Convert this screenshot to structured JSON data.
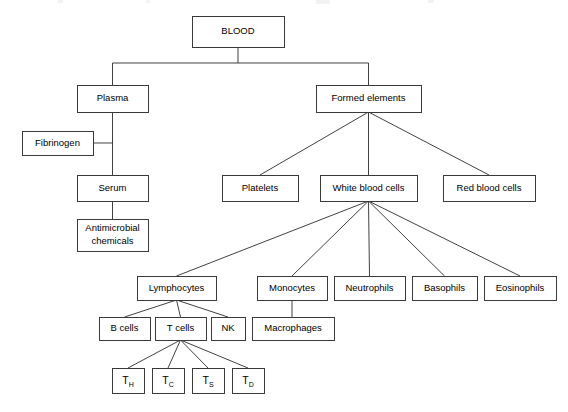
{
  "diagram": {
    "type": "tree-hierarchy",
    "background_color": "#ffffff",
    "box_border_color": "#3a3a3a",
    "connector_color": "#2b2b2b",
    "text_color": "#000000",
    "nodes": [
      {
        "id": "blood",
        "label": "BLOOD",
        "x": 192,
        "y": 16,
        "w": 92,
        "h": 31,
        "lines": 1
      },
      {
        "id": "plasma",
        "label": "Plasma",
        "x": 77,
        "y": 85,
        "w": 71,
        "h": 27,
        "lines": 1
      },
      {
        "id": "formed",
        "label": "Formed elements",
        "x": 316,
        "y": 85,
        "w": 105,
        "h": 27,
        "lines": 1
      },
      {
        "id": "fibrinogen",
        "label": "Fibrinogen",
        "x": 22,
        "y": 131,
        "w": 71,
        "h": 24,
        "lines": 1
      },
      {
        "id": "serum",
        "label": "Serum",
        "x": 77,
        "y": 175,
        "w": 71,
        "h": 26,
        "lines": 1
      },
      {
        "id": "antimicrobial",
        "label": "Antimicrobial chemicals",
        "x": 77,
        "y": 219,
        "w": 71,
        "h": 32,
        "lines": 2,
        "line1": "Antimicrobial",
        "line2": "chemicals"
      },
      {
        "id": "platelets",
        "label": "Platelets",
        "x": 222,
        "y": 175,
        "w": 76,
        "h": 26,
        "lines": 1
      },
      {
        "id": "wbc",
        "label": "White blood cells",
        "x": 320,
        "y": 175,
        "w": 97,
        "h": 26,
        "lines": 1
      },
      {
        "id": "rbc",
        "label": "Red blood cells",
        "x": 443,
        "y": 175,
        "w": 92,
        "h": 26,
        "lines": 1
      },
      {
        "id": "lymphocytes",
        "label": "Lymphocytes",
        "x": 137,
        "y": 276,
        "w": 79,
        "h": 24,
        "lines": 1
      },
      {
        "id": "monocytes",
        "label": "Monocytes",
        "x": 257,
        "y": 276,
        "w": 70,
        "h": 24,
        "lines": 1
      },
      {
        "id": "neutrophils",
        "label": "Neutrophils",
        "x": 334,
        "y": 276,
        "w": 71,
        "h": 24,
        "lines": 1
      },
      {
        "id": "basophils",
        "label": "Basophils",
        "x": 412,
        "y": 276,
        "w": 65,
        "h": 24,
        "lines": 1
      },
      {
        "id": "eosinophils",
        "label": "Eosinophils",
        "x": 484,
        "y": 276,
        "w": 72,
        "h": 24,
        "lines": 1
      },
      {
        "id": "bcells",
        "label": "B cells",
        "x": 99,
        "y": 317,
        "w": 51,
        "h": 23,
        "lines": 1
      },
      {
        "id": "tcells",
        "label": "T cells",
        "x": 155,
        "y": 317,
        "w": 51,
        "h": 23,
        "lines": 1
      },
      {
        "id": "nk",
        "label": "NK",
        "x": 211,
        "y": 317,
        "w": 34,
        "h": 23,
        "lines": 1
      },
      {
        "id": "macrophages",
        "label": "Macrophages",
        "x": 252,
        "y": 317,
        "w": 82,
        "h": 23,
        "lines": 1
      },
      {
        "id": "th",
        "label": "TH",
        "base": "T",
        "sub": "H",
        "x": 112,
        "y": 368,
        "w": 32,
        "h": 25,
        "lines": 1,
        "subscript": true
      },
      {
        "id": "tc",
        "label": "TC",
        "base": "T",
        "sub": "C",
        "x": 152,
        "y": 368,
        "w": 32,
        "h": 25,
        "lines": 1,
        "subscript": true
      },
      {
        "id": "ts",
        "label": "TS",
        "base": "T",
        "sub": "S",
        "x": 192,
        "y": 368,
        "w": 32,
        "h": 25,
        "lines": 1,
        "subscript": true
      },
      {
        "id": "td",
        "label": "TD",
        "base": "T",
        "sub": "D",
        "x": 232,
        "y": 368,
        "w": 32,
        "h": 25,
        "lines": 1,
        "subscript": true
      }
    ],
    "connectors": [
      {
        "id": "blood-split",
        "from": "blood",
        "to": "plasma-and-formed",
        "path": "M238,47 L238,63 M112.5,63 L368.5,63 M112.5,63 L112.5,85 M368.5,63 L368.5,85"
      },
      {
        "id": "plasma-serum",
        "from": "plasma",
        "to": "serum",
        "path": "M112.5,112 L112.5,175"
      },
      {
        "id": "fibrinogen-link",
        "from": "fibrinogen",
        "to": "plasma-serum-line",
        "path": "M93,143 L112.5,143"
      },
      {
        "id": "serum-antimicrobial",
        "from": "serum",
        "to": "antimicrobial",
        "path": "M112.5,201 L112.5,219"
      },
      {
        "id": "formed-platelets",
        "from": "formed",
        "to": "platelets",
        "path": "M368.5,112 L260,175"
      },
      {
        "id": "formed-wbc",
        "from": "formed",
        "to": "wbc",
        "path": "M368.5,112 L368.5,175"
      },
      {
        "id": "formed-rbc",
        "from": "formed",
        "to": "rbc",
        "path": "M368.5,112 L489,175"
      },
      {
        "id": "wbc-lymphocytes",
        "from": "wbc",
        "to": "lymphocytes",
        "path": "M368.5,201 L176.5,276"
      },
      {
        "id": "wbc-monocytes",
        "from": "wbc",
        "to": "monocytes",
        "path": "M368.5,201 L292,276"
      },
      {
        "id": "wbc-neutrophils",
        "from": "wbc",
        "to": "neutrophils",
        "path": "M368.5,201 L369.5,276"
      },
      {
        "id": "wbc-basophils",
        "from": "wbc",
        "to": "basophils",
        "path": "M368.5,201 L444.5,276"
      },
      {
        "id": "wbc-eosinophils",
        "from": "wbc",
        "to": "eosinophils",
        "path": "M368.5,201 L520,276"
      },
      {
        "id": "monocytes-macrophages",
        "from": "monocytes",
        "to": "macrophages",
        "path": "M292,300 L292,317"
      },
      {
        "id": "lymph-bcells",
        "from": "lymphocytes",
        "to": "bcells",
        "path": "M176.5,300 L124.5,317"
      },
      {
        "id": "lymph-tcells",
        "from": "lymphocytes",
        "to": "tcells",
        "path": "M176.5,300 L180.5,317"
      },
      {
        "id": "lymph-nk",
        "from": "lymphocytes",
        "to": "nk",
        "path": "M176.5,300 L228,317"
      },
      {
        "id": "tcells-th",
        "from": "tcells",
        "to": "th",
        "path": "M180.5,340 L128,368"
      },
      {
        "id": "tcells-tc",
        "from": "tcells",
        "to": "tc",
        "path": "M180.5,340 L168,368"
      },
      {
        "id": "tcells-ts",
        "from": "tcells",
        "to": "ts",
        "path": "M180.5,340 L208,368"
      },
      {
        "id": "tcells-td",
        "from": "tcells",
        "to": "td",
        "path": "M180.5,340 L248,368"
      }
    ],
    "artifacts": [
      {
        "id": "artifact-1",
        "x": 58,
        "y": 0,
        "w": 5,
        "h": 3
      },
      {
        "id": "artifact-2",
        "x": 146,
        "y": 0,
        "w": 4,
        "h": 3
      },
      {
        "id": "artifact-3",
        "x": 316,
        "y": 0,
        "w": 14,
        "h": 4
      },
      {
        "id": "artifact-4",
        "x": 428,
        "y": 0,
        "w": 6,
        "h": 3
      }
    ]
  }
}
